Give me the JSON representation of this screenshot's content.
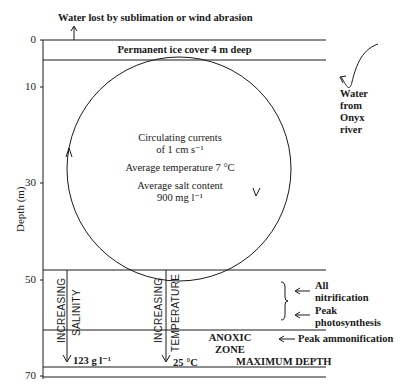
{
  "diagram": {
    "top_label": "Water lost by sublimation or wind abrasion",
    "ice_label": "Permanent ice cover 4 m deep",
    "inflow_label": [
      "Water",
      "from",
      "Onyx",
      "river"
    ],
    "circle_text": {
      "line1": "Circulating currents",
      "line2": "of 1 cm s⁻¹",
      "line3": "Average temperature  7 °C",
      "line4": "Average salt content",
      "line5": "900 mg l⁻¹"
    },
    "y_axis": {
      "label": "Depth (m)",
      "ticks": [
        "0",
        "10",
        "30",
        "50",
        "70"
      ]
    },
    "gradients": {
      "salinity_1": "INCREASING",
      "salinity_2": "SALINITY",
      "salinity_value": "123 g l⁻¹",
      "temperature_1": "INCREASING",
      "temperature_2": "TEMPERATURE",
      "temperature_value": "25 °C"
    },
    "zones": {
      "anoxic_1": "ANOXIC",
      "anoxic_2": "ZONE",
      "max_depth": "MAXIMUM DEPTH"
    },
    "processes": {
      "nitrification_1": "All",
      "nitrification_2": "nitrification",
      "photosynthesis_1": "Peak",
      "photosynthesis_2": "photosynthesis",
      "ammonification": "Peak ammonification"
    }
  }
}
